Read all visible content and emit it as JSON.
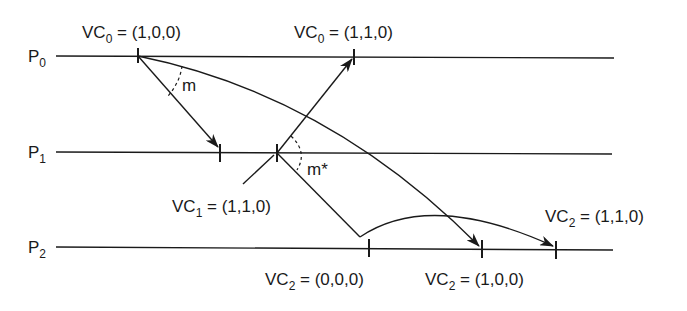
{
  "diagram": {
    "type": "space-time vector clock diagram",
    "processes": [
      {
        "name": "P",
        "sub": "0",
        "y": 56
      },
      {
        "name": "P",
        "sub": "1",
        "y": 153
      },
      {
        "name": "P",
        "sub": "2",
        "y": 248
      }
    ],
    "labels": {
      "vc0_a": {
        "pre": "VC",
        "sub": "0",
        "post": " = (1,0,0)"
      },
      "vc0_b": {
        "pre": "VC",
        "sub": "0",
        "post": " = (1,1,0)"
      },
      "vc1": {
        "pre": "VC",
        "sub": "1",
        "post": " = (1,1,0)"
      },
      "vc2_a": {
        "pre": "VC",
        "sub": "2",
        "post": " = (0,0,0)"
      },
      "vc2_b": {
        "pre": "VC",
        "sub": "2",
        "post": " = (1,0,0)"
      },
      "vc2_c": {
        "pre": "VC",
        "sub": "2",
        "post": " = (1,1,0)"
      }
    },
    "messages": {
      "m": "m",
      "mstar": "m*"
    }
  }
}
